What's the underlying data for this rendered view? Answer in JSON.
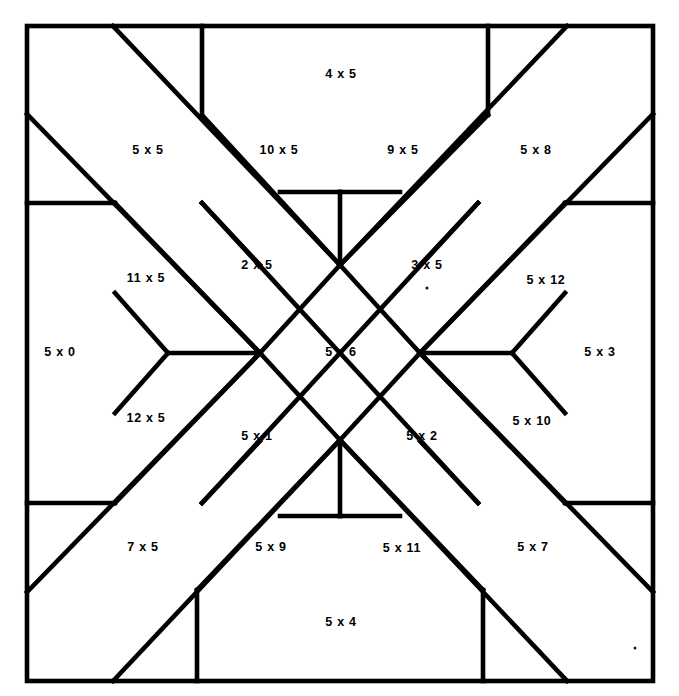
{
  "figure": {
    "kind": "quilt-block-piecing-diagram",
    "shape": "square",
    "line_color": "#000000",
    "background_color": "#ffffff",
    "frame": {
      "x": 27,
      "y": 26,
      "width": 626,
      "height": 655
    }
  },
  "pieces": [
    {
      "id": "p-4x5",
      "label": "4 x 5",
      "x": 341,
      "y": 75
    },
    {
      "id": "p-5x5",
      "label": "5 x 5",
      "x": 148,
      "y": 151
    },
    {
      "id": "p-10x5",
      "label": "10 x 5",
      "x": 279,
      "y": 151
    },
    {
      "id": "p-9x5",
      "label": "9 x 5",
      "x": 403,
      "y": 151
    },
    {
      "id": "p-5x8",
      "label": "5 x 8",
      "x": 536,
      "y": 151
    },
    {
      "id": "p-11x5",
      "label": "11 x 5",
      "x": 146,
      "y": 279
    },
    {
      "id": "p-2x5",
      "label": "2 x 5",
      "x": 257,
      "y": 266
    },
    {
      "id": "p-3x5",
      "label": "3 x 5",
      "x": 427,
      "y": 266
    },
    {
      "id": "p-5x12",
      "label": "5 x 12",
      "x": 546,
      "y": 281
    },
    {
      "id": "p-5x0",
      "label": "5 x 0",
      "x": 60,
      "y": 353
    },
    {
      "id": "p-5x6",
      "label": "5 x 6",
      "x": 341,
      "y": 353
    },
    {
      "id": "p-5x3",
      "label": "5 x 3",
      "x": 600,
      "y": 353
    },
    {
      "id": "p-12x5",
      "label": "12 x 5",
      "x": 146,
      "y": 419
    },
    {
      "id": "p-5x1",
      "label": "5 x 1",
      "x": 257,
      "y": 437
    },
    {
      "id": "p-5x2",
      "label": "5 x 2",
      "x": 422,
      "y": 437
    },
    {
      "id": "p-5x10",
      "label": "5 x 10",
      "x": 532,
      "y": 422
    },
    {
      "id": "p-7x5",
      "label": "7 x 5",
      "x": 143,
      "y": 548
    },
    {
      "id": "p-5x9",
      "label": "5 x 9",
      "x": 271,
      "y": 548
    },
    {
      "id": "p-5x11",
      "label": "5 x 11",
      "x": 402,
      "y": 549
    },
    {
      "id": "p-5x7",
      "label": "5 x 7",
      "x": 533,
      "y": 548
    },
    {
      "id": "p-5x4",
      "label": "5 x 4",
      "x": 341,
      "y": 623
    }
  ],
  "seam_lines": [
    {
      "id": "s01",
      "x1": 113,
      "y1": 26,
      "x2": 340,
      "y2": 265
    },
    {
      "id": "s02",
      "x1": 202,
      "y1": 26,
      "x2": 202,
      "y2": 115
    },
    {
      "id": "s03",
      "x1": 202,
      "y1": 115,
      "x2": 340,
      "y2": 265
    },
    {
      "id": "s04",
      "x1": 27,
      "y1": 114,
      "x2": 260,
      "y2": 353
    },
    {
      "id": "s05",
      "x1": 27,
      "y1": 203,
      "x2": 115,
      "y2": 203
    },
    {
      "id": "s06",
      "x1": 115,
      "y1": 203,
      "x2": 260,
      "y2": 353
    },
    {
      "id": "s07",
      "x1": 202,
      "y1": 203,
      "x2": 340,
      "y2": 353
    },
    {
      "id": "s08",
      "x1": 202,
      "y1": 203,
      "x2": 260,
      "y2": 265
    },
    {
      "id": "s09",
      "x1": 567,
      "y1": 26,
      "x2": 340,
      "y2": 265
    },
    {
      "id": "s10",
      "x1": 488,
      "y1": 26,
      "x2": 488,
      "y2": 115
    },
    {
      "id": "s11",
      "x1": 488,
      "y1": 115,
      "x2": 340,
      "y2": 265
    },
    {
      "id": "s12",
      "x1": 653,
      "y1": 114,
      "x2": 420,
      "y2": 353
    },
    {
      "id": "s13",
      "x1": 653,
      "y1": 203,
      "x2": 565,
      "y2": 203
    },
    {
      "id": "s14",
      "x1": 565,
      "y1": 203,
      "x2": 420,
      "y2": 353
    },
    {
      "id": "s15",
      "x1": 478,
      "y1": 203,
      "x2": 340,
      "y2": 353
    },
    {
      "id": "s16",
      "x1": 478,
      "y1": 203,
      "x2": 420,
      "y2": 265
    },
    {
      "id": "s17",
      "x1": 113,
      "y1": 681,
      "x2": 340,
      "y2": 440
    },
    {
      "id": "s18",
      "x1": 197,
      "y1": 681,
      "x2": 197,
      "y2": 590
    },
    {
      "id": "s19",
      "x1": 197,
      "y1": 590,
      "x2": 340,
      "y2": 440
    },
    {
      "id": "s20",
      "x1": 27,
      "y1": 592,
      "x2": 260,
      "y2": 353
    },
    {
      "id": "s21",
      "x1": 27,
      "y1": 503,
      "x2": 115,
      "y2": 503
    },
    {
      "id": "s22",
      "x1": 115,
      "y1": 503,
      "x2": 260,
      "y2": 353
    },
    {
      "id": "s23",
      "x1": 202,
      "y1": 503,
      "x2": 340,
      "y2": 353
    },
    {
      "id": "s24",
      "x1": 202,
      "y1": 503,
      "x2": 260,
      "y2": 441
    },
    {
      "id": "s25",
      "x1": 567,
      "y1": 681,
      "x2": 340,
      "y2": 440
    },
    {
      "id": "s26",
      "x1": 483,
      "y1": 681,
      "x2": 483,
      "y2": 590
    },
    {
      "id": "s27",
      "x1": 483,
      "y1": 590,
      "x2": 340,
      "y2": 440
    },
    {
      "id": "s28",
      "x1": 653,
      "y1": 592,
      "x2": 420,
      "y2": 353
    },
    {
      "id": "s29",
      "x1": 653,
      "y1": 503,
      "x2": 565,
      "y2": 503
    },
    {
      "id": "s30",
      "x1": 565,
      "y1": 503,
      "x2": 420,
      "y2": 353
    },
    {
      "id": "s31",
      "x1": 478,
      "y1": 503,
      "x2": 340,
      "y2": 353
    },
    {
      "id": "s32",
      "x1": 478,
      "y1": 503,
      "x2": 420,
      "y2": 441
    },
    {
      "id": "s33",
      "x1": 260,
      "y1": 353,
      "x2": 340,
      "y2": 265
    },
    {
      "id": "s34",
      "x1": 340,
      "y1": 265,
      "x2": 420,
      "y2": 353
    },
    {
      "id": "s35",
      "x1": 420,
      "y1": 353,
      "x2": 340,
      "y2": 440
    },
    {
      "id": "s36",
      "x1": 340,
      "y1": 440,
      "x2": 260,
      "y2": 353
    },
    {
      "id": "s37",
      "x1": 168,
      "y1": 353,
      "x2": 260,
      "y2": 353
    },
    {
      "id": "s38",
      "x1": 420,
      "y1": 353,
      "x2": 512,
      "y2": 353
    },
    {
      "id": "s39",
      "x1": 340,
      "y1": 192,
      "x2": 340,
      "y2": 265
    },
    {
      "id": "s40",
      "x1": 340,
      "y1": 440,
      "x2": 340,
      "y2": 516
    },
    {
      "id": "s41",
      "x1": 168,
      "y1": 353,
      "x2": 115,
      "y2": 293
    },
    {
      "id": "s42",
      "x1": 168,
      "y1": 353,
      "x2": 115,
      "y2": 413
    },
    {
      "id": "s43",
      "x1": 512,
      "y1": 353,
      "x2": 565,
      "y2": 293
    },
    {
      "id": "s44",
      "x1": 512,
      "y1": 353,
      "x2": 565,
      "y2": 413
    },
    {
      "id": "s45",
      "x1": 340,
      "y1": 192,
      "x2": 280,
      "y2": 192
    },
    {
      "id": "s46",
      "x1": 340,
      "y1": 192,
      "x2": 400,
      "y2": 192
    },
    {
      "id": "s47",
      "x1": 340,
      "y1": 516,
      "x2": 280,
      "y2": 516
    },
    {
      "id": "s48",
      "x1": 340,
      "y1": 516,
      "x2": 400,
      "y2": 516
    }
  ],
  "specks": [
    {
      "id": "speck-1",
      "x": 427,
      "y": 288,
      "r": 1.6
    },
    {
      "id": "speck-2",
      "x": 635,
      "y": 648,
      "r": 1.5
    }
  ]
}
